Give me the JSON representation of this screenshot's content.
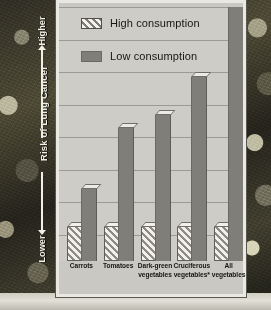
{
  "chart_data": {
    "type": "bar",
    "title": "",
    "xlabel": "",
    "ylabel": "Risk of Lung Cancer",
    "ylim": [
      0,
      100
    ],
    "grid": true,
    "gridlines": 8,
    "legend_position": "top-left",
    "axis_top_cap": "Higher",
    "axis_bottom_cap": "Lower",
    "categories": [
      "Carrots",
      "Tomatoes",
      "Dark-green vegetables",
      "Cruciferous vegetables*",
      "All vegetables"
    ],
    "category_lines": [
      [
        "Carrots"
      ],
      [
        "Tomatoes"
      ],
      [
        "Dark-green",
        "vegetables"
      ],
      [
        "Cruciferous",
        "vegetables*"
      ],
      [
        "All",
        "vegetables"
      ]
    ],
    "series": [
      {
        "name": "High consumption",
        "pattern": "diagonal-hatch",
        "color": "#f2f0e9",
        "values": [
          13,
          13,
          13,
          13,
          13
        ]
      },
      {
        "name": "Low consumption",
        "pattern": "solid",
        "color": "#7f7e79",
        "values": [
          28,
          52,
          57,
          72,
          100
        ]
      }
    ]
  },
  "legend": {
    "items": [
      {
        "label": "High consumption",
        "style": "high"
      },
      {
        "label": "Low consumption",
        "style": "low"
      }
    ]
  },
  "yaxis": {
    "title": "Risk of Lung Cancer",
    "higher": "Higher",
    "lower": "Lower"
  },
  "colors": {
    "panel": "#c9c8c2",
    "plot": "#cdccc6",
    "grid": "#9b9a93",
    "bar_low": "#7f7e79",
    "bar_high": "#f2f0e9",
    "text": "#16150f",
    "axis_text": "#f2efe6"
  }
}
